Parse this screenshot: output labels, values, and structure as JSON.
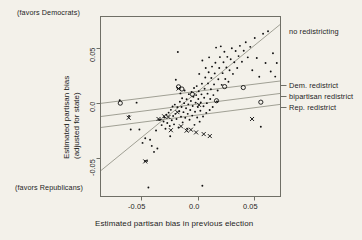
{
  "figure": {
    "kind": "scatter-plot",
    "background_color": "#f3f1ea",
    "frame_color": "#6f6f66",
    "point_color": "#111111",
    "line_color": "#8d8d80"
  },
  "notes": {
    "top_left": "(favors Democrats)",
    "bottom_left": "(favors Republicans)"
  },
  "axes": {
    "x_title": "Estimated partisan bias in previous election",
    "y_title_line1": "Estimated partisan bias",
    "y_title_line2": "(adjusted for state)",
    "x_ticks": [
      "-0.05",
      "0.0",
      "0.05"
    ],
    "y_ticks": [
      "0.05",
      "0.0",
      "-0.05"
    ]
  },
  "legend": {
    "items": [
      {
        "label": "no redistricting"
      },
      {
        "label": "Dem. redistrict"
      },
      {
        "label": "bipartisan redistrict"
      },
      {
        "label": "Rep. redistrict"
      }
    ]
  },
  "chart_data": {
    "type": "scatter",
    "title": "",
    "xlabel": "Estimated partisan bias in previous election",
    "ylabel": "Estimated partisan bias (adjusted for state)",
    "xlim": [
      -0.0866,
      0.0735
    ],
    "ylim": [
      -0.0796,
      0.0681
    ],
    "xticks": [
      -0.05,
      0.0,
      0.05
    ],
    "yticks": [
      -0.05,
      0.0,
      0.05
    ],
    "grid": false,
    "legend_position": "right-outside",
    "annotations": [
      "(favors Democrats)",
      "(favors Republicans)"
    ],
    "series": [
      {
        "name": "no redistricting",
        "marker": "dot",
        "points": [
          [
            -0.0695,
            -0.0006
          ],
          [
            -0.0612,
            -0.0136
          ],
          [
            -0.0597,
            -0.0246
          ],
          [
            -0.0545,
            -0.0026
          ],
          [
            -0.052,
            -0.0246
          ],
          [
            -0.0492,
            -0.0356
          ],
          [
            -0.047,
            -0.0505
          ],
          [
            -0.0468,
            -0.0318
          ],
          [
            -0.0452,
            -0.0504
          ],
          [
            -0.044,
            -0.0722
          ],
          [
            -0.0425,
            -0.033
          ],
          [
            -0.041,
            -0.0381
          ],
          [
            -0.039,
            -0.043
          ],
          [
            -0.0372,
            -0.0254
          ],
          [
            -0.036,
            -0.0402
          ],
          [
            -0.0345,
            -0.0168
          ],
          [
            -0.033,
            -0.0163
          ],
          [
            -0.0322,
            -0.021
          ],
          [
            -0.0305,
            -0.018
          ],
          [
            -0.03,
            -0.0146
          ],
          [
            -0.0288,
            -0.024
          ],
          [
            -0.028,
            -0.0124
          ],
          [
            -0.0272,
            -0.0193
          ],
          [
            -0.026,
            -0.0108
          ],
          [
            -0.025,
            -0.0218
          ],
          [
            -0.0246,
            -0.0302
          ],
          [
            -0.024,
            -0.0085
          ],
          [
            -0.0232,
            -0.017
          ],
          [
            -0.0225,
            -0.0057
          ],
          [
            -0.022,
            -0.0136
          ],
          [
            -0.0212,
            -0.0204
          ],
          [
            -0.0205,
            -0.0042
          ],
          [
            -0.02,
            -0.0118
          ],
          [
            -0.0196,
            0.0162
          ],
          [
            -0.019,
            -0.016
          ],
          [
            -0.0182,
            -0.0064
          ],
          [
            -0.0178,
            0.039
          ],
          [
            -0.0172,
            -0.023
          ],
          [
            -0.0165,
            -0.0096
          ],
          [
            -0.016,
            -0.0018
          ],
          [
            -0.0155,
            0.005
          ],
          [
            -0.015,
            -0.0142
          ],
          [
            -0.0145,
            -0.0062
          ],
          [
            -0.014,
            0.001
          ],
          [
            -0.0135,
            -0.0188
          ],
          [
            -0.0128,
            -0.0104
          ],
          [
            -0.0122,
            -0.003
          ],
          [
            -0.0118,
            0.0074
          ],
          [
            -0.0112,
            -0.015
          ],
          [
            -0.0105,
            -0.0072
          ],
          [
            -0.01,
            0.0002
          ],
          [
            -0.0096,
            -0.024
          ],
          [
            -0.009,
            -0.0118
          ],
          [
            -0.0085,
            -0.004
          ],
          [
            -0.008,
            0.0044
          ],
          [
            -0.0074,
            -0.0166
          ],
          [
            -0.0068,
            -0.0086
          ],
          [
            -0.0062,
            -0.0012
          ],
          [
            -0.0056,
            0.0062
          ],
          [
            -0.005,
            -0.0132
          ],
          [
            -0.0046,
            -0.0054
          ],
          [
            -0.004,
            0.0022
          ],
          [
            -0.0034,
            0.0094
          ],
          [
            -0.003,
            -0.0208
          ],
          [
            -0.0025,
            -0.01
          ],
          [
            -0.002,
            -0.0026
          ],
          [
            -0.0015,
            0.0036
          ],
          [
            -0.001,
            0.011
          ],
          [
            -0.0006,
            -0.0148
          ],
          [
            0.0,
            -0.0062
          ],
          [
            0.0004,
            0.0004
          ],
          [
            0.0008,
            0.0068
          ],
          [
            0.0012,
            0.021
          ],
          [
            0.0016,
            -0.0182
          ],
          [
            0.0022,
            -0.0092
          ],
          [
            0.0026,
            -0.0024
          ],
          [
            0.0032,
            0.0042
          ],
          [
            0.0036,
            0.013
          ],
          [
            0.004,
            0.032
          ],
          [
            0.0046,
            -0.014
          ],
          [
            0.005,
            -0.0056
          ],
          [
            0.0056,
            0.0014
          ],
          [
            0.006,
            0.0088
          ],
          [
            0.0066,
            0.018
          ],
          [
            0.007,
            0.0258
          ],
          [
            0.0075,
            -0.011
          ],
          [
            0.008,
            -0.003
          ],
          [
            0.0086,
            0.0048
          ],
          [
            0.009,
            0.0132
          ],
          [
            0.0096,
            0.0224
          ],
          [
            0.01,
            0.0346
          ],
          [
            0.0105,
            -0.0086
          ],
          [
            0.011,
            0.0004
          ],
          [
            0.0116,
            0.0084
          ],
          [
            0.012,
            0.0176
          ],
          [
            0.0126,
            0.027
          ],
          [
            0.0132,
            -0.0062
          ],
          [
            0.0138,
            0.0036
          ],
          [
            0.0144,
            0.0124
          ],
          [
            0.015,
            0.0214
          ],
          [
            0.0156,
            0.0302
          ],
          [
            0.0162,
            0.0426
          ],
          [
            0.017,
            -0.0016
          ],
          [
            0.0176,
            0.0074
          ],
          [
            0.0182,
            0.0166
          ],
          [
            0.019,
            0.0258
          ],
          [
            0.0196,
            0.0348
          ],
          [
            0.0204,
            0.0436
          ],
          [
            0.0212,
            0.012
          ],
          [
            0.022,
            0.0216
          ],
          [
            0.0228,
            0.0306
          ],
          [
            0.0236,
            0.0392
          ],
          [
            0.0244,
            0.0168
          ],
          [
            0.0254,
            0.0262
          ],
          [
            0.0262,
            0.035
          ],
          [
            0.0272,
            0.0146
          ],
          [
            0.0282,
            0.024
          ],
          [
            0.0292,
            0.033
          ],
          [
            0.0302,
            0.042
          ],
          [
            0.0312,
            0.021
          ],
          [
            0.0324,
            0.0306
          ],
          [
            0.0336,
            0.0398
          ],
          [
            0.035,
            0.0258
          ],
          [
            0.0362,
            0.0356
          ],
          [
            0.0374,
            0.044
          ],
          [
            0.0392,
            0.031
          ],
          [
            0.0408,
            0.04
          ],
          [
            0.0426,
            0.047
          ],
          [
            0.0444,
            0.0346
          ],
          [
            0.0466,
            0.0432
          ],
          [
            0.0484,
            0.024
          ],
          [
            0.0506,
            0.0504
          ],
          [
            0.0524,
            0.034
          ],
          [
            0.0546,
            0.0186
          ],
          [
            0.056,
            -0.0224
          ],
          [
            0.058,
            0.054
          ],
          [
            0.0602,
            0.03
          ],
          [
            0.0624,
            0.056
          ],
          [
            0.0648,
            0.023
          ],
          [
            0.0668,
            0.038
          ],
          [
            0.0688,
            0.0188
          ],
          [
            0.0702,
            0.03
          ],
          [
            0.004,
            -0.0708
          ]
        ]
      },
      {
        "name": "Dem. redistrict",
        "marker": "o",
        "points": [
          [
            -0.069,
            -0.003
          ],
          [
            -0.0172,
            0.0104
          ],
          [
            -0.0142,
            0.0086
          ],
          [
            -0.0048,
            0.0042
          ],
          [
            0.0238,
            0.0106
          ],
          [
            0.0404,
            0.0098
          ],
          [
            0.0166,
            -0.001
          ],
          [
            0.056,
            -0.0022
          ]
        ]
      },
      {
        "name": "Rep. redistrict",
        "marker": "x",
        "points": [
          [
            -0.0615,
            -0.015
          ],
          [
            -0.0468,
            -0.0508
          ],
          [
            -0.035,
            -0.016
          ],
          [
            -0.03,
            -0.0138
          ],
          [
            -0.0262,
            -0.0144
          ],
          [
            -0.024,
            -0.0252
          ],
          [
            -0.0182,
            -0.0104
          ],
          [
            -0.0172,
            0.009
          ],
          [
            -0.015,
            -0.022
          ],
          [
            -0.01,
            -0.0256
          ],
          [
            -0.0062,
            -0.0248
          ],
          [
            -0.0016,
            -0.027
          ],
          [
            0.001,
            -0.0044
          ],
          [
            0.0052,
            -0.0284
          ],
          [
            0.0106,
            -0.03
          ],
          [
            0.0482,
            -0.016
          ]
        ]
      }
    ],
    "fit_lines": [
      {
        "name": "no redistricting",
        "p1": [
          -0.0866,
          -0.0586
        ],
        "p2": [
          0.0735,
          0.0618
        ]
      },
      {
        "name": "Dem. redistrict",
        "p1": [
          -0.0866,
          -0.0032
        ],
        "p2": [
          0.0735,
          0.0152
        ]
      },
      {
        "name": "bipartisan redistrict",
        "p1": [
          -0.0866,
          -0.014
        ],
        "p2": [
          0.0735,
          0.005
        ]
      },
      {
        "name": "Rep. redistrict",
        "p1": [
          -0.0866,
          -0.023
        ],
        "p2": [
          0.0735,
          -0.004
        ]
      }
    ]
  }
}
